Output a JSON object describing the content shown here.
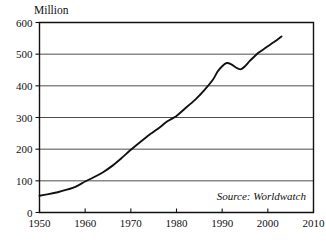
{
  "chart_data": {
    "type": "line",
    "title": "",
    "subtitle": "",
    "unit_label": "Million",
    "xlabel": "",
    "ylabel": "Million",
    "xlim": [
      1950,
      2010
    ],
    "ylim": [
      0,
      600
    ],
    "xticks": [
      1950,
      1960,
      1970,
      1980,
      1990,
      2000,
      2010
    ],
    "xtick_labels": [
      "1950",
      "1960",
      "1970",
      "1980",
      "1990",
      "2000",
      "2010"
    ],
    "yticks": [
      0,
      100,
      200,
      300,
      400,
      500,
      600
    ],
    "ytick_labels": [
      "0",
      "100",
      "200",
      "300",
      "400",
      "500",
      "600"
    ],
    "grid": "horizontal",
    "legend": "none",
    "annotation": "Source: Worldwatch",
    "series": [
      {
        "name": "Million",
        "color": "#111111",
        "x": [
          1950,
          1952,
          1954,
          1956,
          1958,
          1960,
          1962,
          1964,
          1966,
          1968,
          1970,
          1972,
          1974,
          1976,
          1978,
          1980,
          1982,
          1984,
          1986,
          1988,
          1989,
          1990,
          1991,
          1992,
          1993,
          1994,
          1995,
          1996,
          1997,
          1998,
          1999,
          2000,
          2001,
          2002,
          2003
        ],
        "values": [
          53,
          58,
          64,
          72,
          82,
          98,
          112,
          128,
          148,
          172,
          198,
          222,
          245,
          265,
          288,
          305,
          330,
          355,
          385,
          420,
          445,
          462,
          472,
          468,
          458,
          452,
          462,
          478,
          492,
          505,
          515,
          525,
          535,
          545,
          556
        ]
      }
    ]
  }
}
